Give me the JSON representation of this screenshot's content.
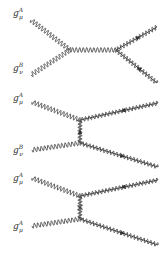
{
  "colors": {
    "line": "#333333",
    "background": "#ffffff"
  },
  "diagrams": [
    {
      "name": "s-channel",
      "labels": [
        {
          "base": "g",
          "sup": "A",
          "sub": "μ",
          "x": 13,
          "y": 9
        },
        {
          "base": "g",
          "sup": "B",
          "sub": "ν",
          "x": 13,
          "y": 64
        }
      ],
      "incoming": [
        {
          "from": [
            31,
            20
          ],
          "to": [
            70,
            50
          ]
        },
        {
          "from": [
            31,
            75
          ],
          "to": [
            70,
            50
          ]
        }
      ],
      "propagator": {
        "type": "gluon",
        "from": [
          70,
          50
        ],
        "to": [
          116,
          50
        ]
      },
      "outgoing": [
        {
          "type": "gluino",
          "from": [
            116,
            50
          ],
          "to": [
            157,
            27
          ],
          "arrow_at": 0.55,
          "arrow_dir": "forward"
        },
        {
          "type": "gluino",
          "from": [
            116,
            50
          ],
          "to": [
            157,
            83
          ],
          "arrow_at": 0.55,
          "arrow_dir": "backward"
        }
      ]
    },
    {
      "name": "t-channel",
      "labels": [
        {
          "base": "g",
          "sup": "A",
          "sub": "μ",
          "x": 13,
          "y": 94
        },
        {
          "base": "g",
          "sup": "B",
          "sub": "ν",
          "x": 13,
          "y": 146
        }
      ],
      "incoming": [
        {
          "from": [
            32,
            102
          ],
          "to": [
            80,
            120
          ]
        },
        {
          "from": [
            32,
            150
          ],
          "to": [
            80,
            143
          ]
        }
      ],
      "propagator": {
        "type": "gluino",
        "from": [
          80,
          120
        ],
        "to": [
          80,
          143
        ],
        "arrow_dir": "up",
        "crossed": false
      },
      "outgoing": [
        {
          "type": "gluino",
          "from": [
            80,
            120
          ],
          "to": [
            158,
            103
          ],
          "arrow_at": 0.55,
          "arrow_dir": "backward"
        },
        {
          "type": "gluino",
          "from": [
            80,
            143
          ],
          "to": [
            158,
            167
          ],
          "arrow_at": 0.55,
          "arrow_dir": "forward"
        }
      ]
    },
    {
      "name": "u-channel",
      "labels": [
        {
          "base": "g",
          "sup": "A",
          "sub": "μ",
          "x": 13,
          "y": 174
        },
        {
          "base": "g",
          "sup": "A",
          "sub": "μ",
          "x": 13,
          "y": 222
        }
      ],
      "incoming": [
        {
          "from": [
            32,
            178
          ],
          "to": [
            80,
            196
          ]
        },
        {
          "from": [
            32,
            226
          ],
          "to": [
            80,
            219
          ]
        }
      ],
      "propagator": {
        "type": "gluino",
        "from": [
          80,
          196
        ],
        "to": [
          80,
          219
        ],
        "crossed": true
      },
      "outgoing": [
        {
          "type": "gluino",
          "from": [
            80,
            196
          ],
          "to": [
            158,
            180
          ],
          "arrow_at": 0.55,
          "arrow_dir": "backward"
        },
        {
          "type": "gluino",
          "from": [
            80,
            219
          ],
          "to": [
            158,
            245
          ],
          "arrow_at": 0.55,
          "arrow_dir": "forward"
        }
      ]
    }
  ]
}
